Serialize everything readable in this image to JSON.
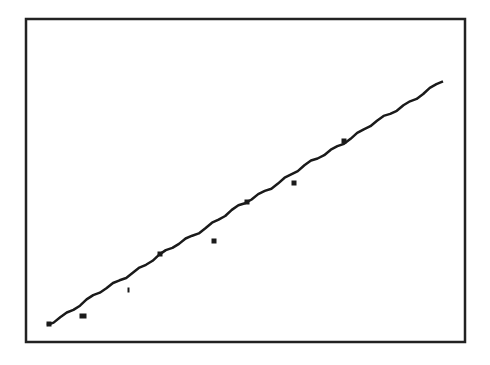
{
  "chart_data": {
    "type": "scatter",
    "title": "",
    "xlabel": "",
    "ylabel": "",
    "grid": false,
    "legend": null,
    "axis_ticks": "none visible",
    "frame": {
      "x0": 26,
      "y0": 19,
      "x1": 465,
      "y1": 342
    },
    "points_pixel": [
      {
        "x": 49,
        "y": 324
      },
      {
        "x": 83,
        "y": 316
      },
      {
        "x": 130,
        "y": 290
      },
      {
        "x": 160,
        "y": 254
      },
      {
        "x": 214,
        "y": 241
      },
      {
        "x": 247,
        "y": 202
      },
      {
        "x": 294,
        "y": 183
      },
      {
        "x": 344,
        "y": 141
      }
    ],
    "points_normalized": [
      {
        "x": 0.05,
        "y": 0.05
      },
      {
        "x": 0.13,
        "y": 0.08
      },
      {
        "x": 0.24,
        "y": 0.16
      },
      {
        "x": 0.31,
        "y": 0.27
      },
      {
        "x": 0.43,
        "y": 0.31
      },
      {
        "x": 0.5,
        "y": 0.43
      },
      {
        "x": 0.61,
        "y": 0.49
      },
      {
        "x": 0.72,
        "y": 0.62
      }
    ],
    "fit_line_pixel": {
      "x0": 47,
      "y0": 325,
      "x1": 443,
      "y1": 81
    },
    "fit_line_normalized": {
      "x0": 0.05,
      "y0": 0.05,
      "x1": 0.95,
      "y1": 0.81
    },
    "series": [
      {
        "name": "observations",
        "style": "square markers"
      },
      {
        "name": "trend",
        "style": "solid jagged line"
      }
    ]
  },
  "colors": {
    "background": "#ffffff",
    "ink": "#1a1a1a",
    "frame": "#222222"
  }
}
